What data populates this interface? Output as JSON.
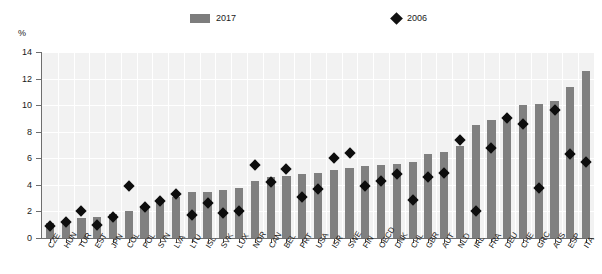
{
  "chart_data": {
    "type": "bar",
    "title": "",
    "subtitle": "",
    "xlabel": "",
    "ylabel": "%",
    "ylim": [
      0,
      14
    ],
    "yticks": [
      0,
      2,
      4,
      6,
      8,
      10,
      12,
      14
    ],
    "grid": true,
    "legend_position": "top",
    "categories": [
      "CZE",
      "HUN",
      "TUR",
      "EST",
      "JPN",
      "COL",
      "POL",
      "SVN",
      "LVA",
      "LTU",
      "ISL",
      "SVK",
      "LUX",
      "NOR",
      "CAN",
      "BEL",
      "PRT",
      "USA",
      "ISR",
      "SWE",
      "FIN",
      "OECD",
      "DNK",
      "CHL",
      "GBR",
      "AUT",
      "NLD",
      "IRL",
      "FRA",
      "DEU",
      "CHE",
      "GRC",
      "AUS",
      "ESP",
      "ITA"
    ],
    "series": [
      {
        "name": "2017",
        "type": "bar",
        "color": "#808080",
        "values": [
          1.1,
          1.3,
          1.5,
          1.6,
          1.8,
          2.0,
          2.4,
          2.9,
          3.1,
          3.5,
          3.5,
          3.6,
          3.8,
          4.3,
          4.6,
          4.7,
          4.8,
          4.9,
          5.1,
          5.3,
          5.4,
          5.5,
          5.6,
          5.7,
          6.3,
          6.5,
          6.9,
          8.5,
          8.9,
          9.2,
          10.0,
          10.1,
          10.3,
          11.4,
          12.6
        ]
      },
      {
        "name": "2006",
        "type": "scatter",
        "marker": "diamond",
        "color": "#0d0d0d",
        "values": [
          1.2,
          1.5,
          2.3,
          1.3,
          1.9,
          4.2,
          2.6,
          3.1,
          3.6,
          2.0,
          2.9,
          2.2,
          2.3,
          5.8,
          4.5,
          5.5,
          3.4,
          4.0,
          6.3,
          6.7,
          4.2,
          4.6,
          5.1,
          3.2,
          4.9,
          5.2,
          7.7,
          2.3,
          7.1,
          9.3,
          8.9,
          4.1,
          9.9,
          6.6,
          6.0
        ]
      }
    ],
    "legend": [
      {
        "label": "2017",
        "marker": "bar",
        "color": "#808080"
      },
      {
        "label": "2006",
        "marker": "diamond",
        "color": "#0d0d0d"
      }
    ]
  }
}
